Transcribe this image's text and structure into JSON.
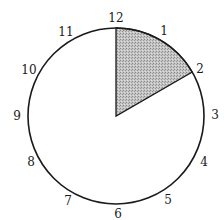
{
  "diagram": {
    "type": "clock-face",
    "center": {
      "x": 116,
      "y": 116
    },
    "radius": 88,
    "stroke_color": "#1a1a1a",
    "shaded_sector": {
      "from_hour": 12,
      "to_hour": 2,
      "fill_color": "#b4b4b4",
      "pattern": "stipple"
    },
    "hour_labels": [
      {
        "hour": 12,
        "text": "12",
        "x": 116,
        "y": 22
      },
      {
        "hour": 1,
        "text": "1",
        "x": 164,
        "y": 35
      },
      {
        "hour": 2,
        "text": "2",
        "x": 200,
        "y": 73
      },
      {
        "hour": 3,
        "text": "3",
        "x": 215,
        "y": 119
      },
      {
        "hour": 4,
        "text": "4",
        "x": 204,
        "y": 166
      },
      {
        "hour": 5,
        "text": "5",
        "x": 168,
        "y": 204
      },
      {
        "hour": 6,
        "text": "6",
        "x": 118,
        "y": 218
      },
      {
        "hour": 7,
        "text": "7",
        "x": 68,
        "y": 205
      },
      {
        "hour": 8,
        "text": "8",
        "x": 31,
        "y": 166
      },
      {
        "hour": 9,
        "text": "9",
        "x": 17,
        "y": 120
      },
      {
        "hour": 10,
        "text": "10",
        "x": 29,
        "y": 74
      },
      {
        "hour": 11,
        "text": "11",
        "x": 66,
        "y": 36
      }
    ]
  }
}
